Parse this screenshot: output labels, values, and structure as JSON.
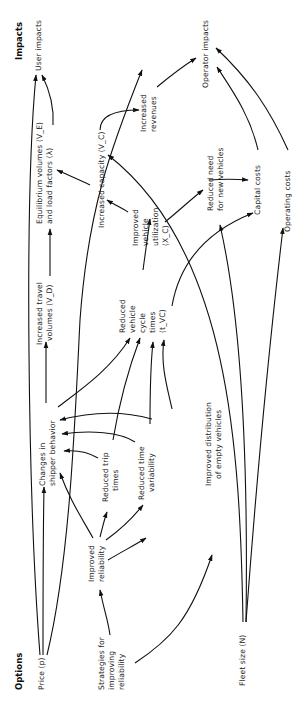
{
  "diagram": {
    "orientation": "rotated-90-ccw",
    "headers": {
      "options": "Options",
      "impacts": "Impacts"
    },
    "nodes": {
      "price": "Price (p)",
      "strategies_1": "Strategies for",
      "strategies_2": "improving",
      "strategies_3": "reliability",
      "fleet_size": "Fleet size (N)",
      "improved_reliability_1": "Improved",
      "improved_reliability_2": "reliability",
      "changes_shipper_1": "Changes in",
      "changes_shipper_2": "shipper behavior",
      "reduced_trip_1": "Reduced trip",
      "reduced_trip_2": "times",
      "reduced_time_var_1": "Reduced time",
      "reduced_time_var_2": "variability",
      "improved_distribution_1": "Improved distribution",
      "improved_distribution_2": "of empty vehicles",
      "increased_travel_1": "Increased travel",
      "increased_travel_2": "volumes (V_D)",
      "reduced_cycle_1": "Reduced",
      "reduced_cycle_2": "vehicle",
      "reduced_cycle_3": "cycle",
      "reduced_cycle_4": "times",
      "reduced_cycle_5": "(t_VC)",
      "equilibrium_1": "Equilibrium volumes (V_E)",
      "equilibrium_2": "and load factors (λ)",
      "increased_capacity": "Increased capacity (V_C)",
      "improved_utilization_1": "Improved",
      "improved_utilization_2": "vehicle",
      "improved_utilization_3": "utilization",
      "improved_utilization_4": "(X_C)",
      "increased_revenues_1": "Increased",
      "increased_revenues_2": "revenues",
      "reduced_need_1": "Reduced need",
      "reduced_need_2": "for new vehicles",
      "capital_costs": "Capital costs",
      "operating_costs": "Operating costs",
      "user_impacts": "User impacts",
      "operator_impacts": "Operator impacts"
    },
    "edges": [
      [
        "Price (p)",
        "User impacts"
      ],
      [
        "Price (p)",
        "Changes in shipper behavior"
      ],
      [
        "Price (p)",
        "Increased revenues"
      ],
      [
        "Strategies for improving reliability",
        "Improved reliability"
      ],
      [
        "Strategies for improving reliability",
        "Improved distribution of empty vehicles"
      ],
      [
        "Improved reliability",
        "Changes in shipper behavior"
      ],
      [
        "Improved reliability",
        "Reduced trip times"
      ],
      [
        "Improved reliability",
        "Reduced time variability"
      ],
      [
        "Improved reliability",
        "Improved distribution of empty vehicles"
      ],
      [
        "Reduced trip times",
        "Changes in shipper behavior"
      ],
      [
        "Reduced time variability",
        "Changes in shipper behavior"
      ],
      [
        "Improved distribution of empty vehicles",
        "Changes in shipper behavior"
      ],
      [
        "Reduced trip times",
        "Reduced vehicle cycle times"
      ],
      [
        "Reduced time variability",
        "Reduced vehicle cycle times"
      ],
      [
        "Improved distribution of empty vehicles",
        "Reduced vehicle cycle times"
      ],
      [
        "Changes in shipper behavior",
        "Increased travel volumes"
      ],
      [
        "Changes in shipper behavior",
        "Reduced vehicle cycle times"
      ],
      [
        "Increased travel volumes",
        "Equilibrium volumes and load factors"
      ],
      [
        "Reduced vehicle cycle times",
        "Improved vehicle utilization"
      ],
      [
        "Reduced vehicle cycle times",
        "Capital costs"
      ],
      [
        "Improved vehicle utilization",
        "Increased capacity"
      ],
      [
        "Improved vehicle utilization",
        "Reduced need for new vehicles"
      ],
      [
        "Increased capacity",
        "Equilibrium volumes and load factors"
      ],
      [
        "Increased capacity",
        "Increased revenues"
      ],
      [
        "Equilibrium volumes and load factors",
        "User impacts"
      ],
      [
        "Fleet size (N)",
        "Increased capacity"
      ],
      [
        "Fleet size (N)",
        "Reduced need for new vehicles"
      ],
      [
        "Fleet size (N)",
        "Operating costs"
      ],
      [
        "Increased revenues",
        "Operator impacts"
      ],
      [
        "Reduced need for new vehicles",
        "Capital costs"
      ],
      [
        "Capital costs",
        "Operator impacts"
      ],
      [
        "Operating costs",
        "Operator impacts"
      ]
    ]
  }
}
